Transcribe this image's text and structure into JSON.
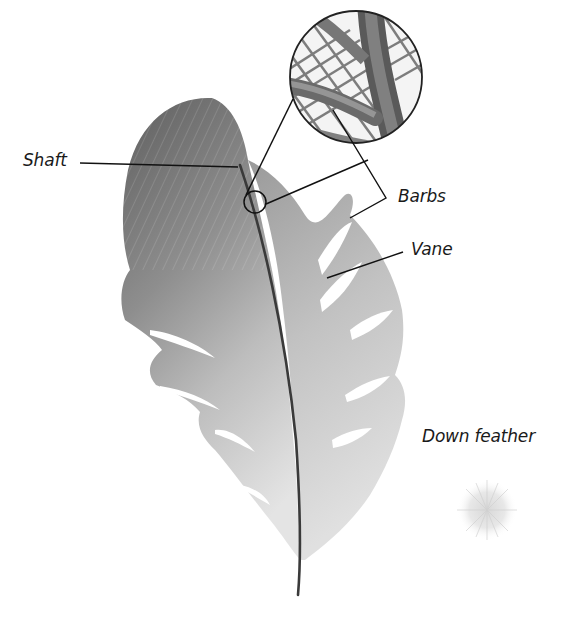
{
  "labels": {
    "shaft": "Shaft",
    "barbs": "Barbs",
    "vane": "Vane",
    "down_feather": "Down feather"
  },
  "colors": {
    "background": "#ffffff",
    "feather_dark": "#6f6f6f",
    "feather_light": "#d9d9d9",
    "shaft": "#3a3a3a",
    "leader_lines": "#111111"
  }
}
